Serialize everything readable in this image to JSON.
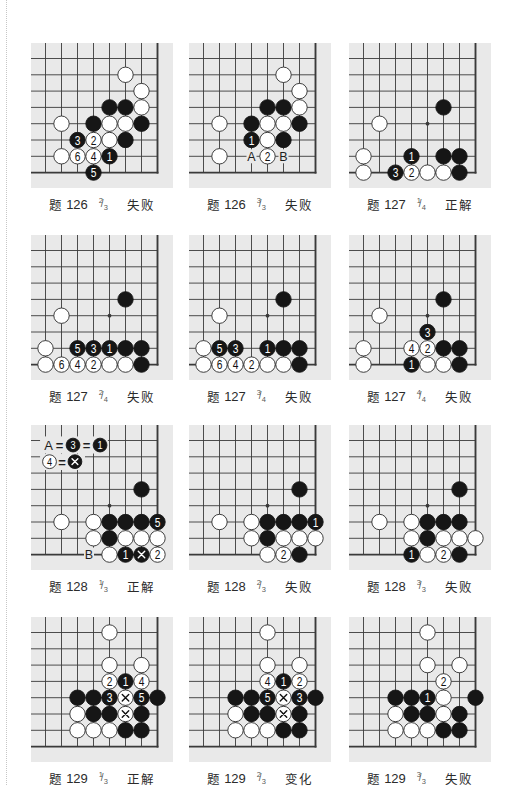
{
  "colors": {
    "board": "#e9e9e9",
    "line": "#3a3a3a",
    "black": "#161616",
    "white": "#ffffff",
    "stone_edge": "#2a2a2a",
    "caption": "#2b2b2b"
  },
  "diagrams": [
    {
      "problem_label": "题",
      "problem_number": "126",
      "step": {
        "num": "2",
        "sep": "/",
        "den": "3"
      },
      "result": "失败",
      "stones": [
        [
          "w",
          5,
          1
        ],
        [
          "w",
          6,
          2
        ],
        [
          "b",
          4,
          3
        ],
        [
          "b",
          5,
          3
        ],
        [
          "w",
          6,
          3
        ],
        [
          "w",
          1,
          4
        ],
        [
          "b",
          3,
          4
        ],
        [
          "w",
          4,
          4
        ],
        [
          "w",
          5,
          4
        ],
        [
          "b",
          6,
          4
        ],
        [
          "b",
          2,
          5,
          "3"
        ],
        [
          "w",
          3,
          5,
          "2"
        ],
        [
          "w",
          4,
          5
        ],
        [
          "b",
          5,
          5
        ],
        [
          "w",
          1,
          6
        ],
        [
          "w",
          2,
          6,
          "6"
        ],
        [
          "w",
          3,
          6,
          "4"
        ],
        [
          "b",
          4,
          6,
          "1"
        ],
        [
          "b",
          3,
          7,
          "5"
        ]
      ]
    },
    {
      "problem_label": "题",
      "problem_number": "126",
      "step": {
        "num": "3",
        "sep": "/",
        "den": "3"
      },
      "result": "失败",
      "stones": [
        [
          "w",
          5,
          1
        ],
        [
          "w",
          6,
          2
        ],
        [
          "b",
          4,
          3
        ],
        [
          "b",
          5,
          3
        ],
        [
          "w",
          6,
          3
        ],
        [
          "w",
          1,
          4
        ],
        [
          "b",
          3,
          4
        ],
        [
          "w",
          4,
          4
        ],
        [
          "w",
          5,
          4
        ],
        [
          "b",
          6,
          4
        ],
        [
          "b",
          3,
          5,
          "1"
        ],
        [
          "w",
          4,
          5
        ],
        [
          "b",
          5,
          5
        ],
        [
          "w",
          1,
          6
        ],
        [
          "w",
          4,
          6,
          "2"
        ]
      ],
      "labels": [
        {
          "col": 3,
          "row": 6,
          "text": "A"
        },
        {
          "col": 5,
          "row": 6,
          "text": "B"
        }
      ]
    },
    {
      "problem_label": "题",
      "problem_number": "127",
      "step": {
        "num": "1",
        "sep": "/",
        "den": "4"
      },
      "result": "正解",
      "stones": [
        [
          "b",
          5,
          3
        ],
        [
          "w",
          1,
          4
        ],
        [
          "w",
          0,
          6
        ],
        [
          "b",
          3,
          6,
          "1"
        ],
        [
          "b",
          5,
          6
        ],
        [
          "b",
          6,
          6
        ],
        [
          "w",
          0,
          7
        ],
        [
          "b",
          2,
          7,
          "3"
        ],
        [
          "w",
          3,
          7,
          "2"
        ],
        [
          "w",
          4,
          7
        ],
        [
          "w",
          5,
          7
        ],
        [
          "b",
          6,
          7
        ]
      ]
    },
    {
      "problem_label": "题",
      "problem_number": "127",
      "step": {
        "num": "2",
        "sep": "/",
        "den": "4"
      },
      "result": "失败",
      "stones": [
        [
          "b",
          5,
          3
        ],
        [
          "w",
          1,
          4
        ],
        [
          "w",
          0,
          6
        ],
        [
          "b",
          2,
          6,
          "5"
        ],
        [
          "b",
          3,
          6,
          "3"
        ],
        [
          "b",
          4,
          6,
          "1"
        ],
        [
          "b",
          5,
          6
        ],
        [
          "b",
          6,
          6
        ],
        [
          "w",
          0,
          7
        ],
        [
          "w",
          1,
          7,
          "6"
        ],
        [
          "w",
          2,
          7,
          "4"
        ],
        [
          "w",
          3,
          7,
          "2"
        ],
        [
          "w",
          4,
          7
        ],
        [
          "w",
          5,
          7
        ],
        [
          "b",
          6,
          7
        ]
      ]
    },
    {
      "problem_label": "题",
      "problem_number": "127",
      "step": {
        "num": "3",
        "sep": "/",
        "den": "4"
      },
      "result": "失败",
      "stones": [
        [
          "b",
          5,
          3
        ],
        [
          "w",
          1,
          4
        ],
        [
          "w",
          0,
          6
        ],
        [
          "b",
          1,
          6,
          "5"
        ],
        [
          "b",
          2,
          6,
          "3"
        ],
        [
          "b",
          4,
          6,
          "1"
        ],
        [
          "b",
          5,
          6
        ],
        [
          "b",
          6,
          6
        ],
        [
          "w",
          0,
          7
        ],
        [
          "w",
          1,
          7,
          "6"
        ],
        [
          "w",
          2,
          7,
          "4"
        ],
        [
          "w",
          3,
          7,
          "2"
        ],
        [
          "w",
          4,
          7
        ],
        [
          "w",
          5,
          7
        ],
        [
          "b",
          6,
          7
        ]
      ]
    },
    {
      "problem_label": "题",
      "problem_number": "127",
      "step": {
        "num": "4",
        "sep": "/",
        "den": "4"
      },
      "result": "失败",
      "stones": [
        [
          "b",
          5,
          3
        ],
        [
          "w",
          1,
          4
        ],
        [
          "b",
          4,
          5,
          "3"
        ],
        [
          "w",
          0,
          6
        ],
        [
          "w",
          3,
          6,
          "4"
        ],
        [
          "w",
          4,
          6,
          "2"
        ],
        [
          "b",
          5,
          6
        ],
        [
          "b",
          6,
          6
        ],
        [
          "w",
          0,
          7
        ],
        [
          "b",
          3,
          7,
          "1"
        ],
        [
          "w",
          4,
          7
        ],
        [
          "w",
          5,
          7
        ],
        [
          "b",
          6,
          7
        ]
      ]
    },
    {
      "problem_label": "题",
      "problem_number": "128",
      "step": {
        "num": "1",
        "sep": "/",
        "den": "3"
      },
      "result": "正解",
      "stones": [
        [
          "b",
          6,
          3
        ],
        [
          "w",
          1,
          5
        ],
        [
          "w",
          3,
          5
        ],
        [
          "b",
          4,
          5
        ],
        [
          "b",
          5,
          5
        ],
        [
          "b",
          6,
          5
        ],
        [
          "b",
          7,
          5,
          "5"
        ],
        [
          "w",
          3,
          6
        ],
        [
          "b",
          4,
          6
        ],
        [
          "w",
          5,
          6
        ],
        [
          "w",
          6,
          6
        ],
        [
          "w",
          7,
          6
        ],
        [
          "w",
          4,
          7
        ],
        [
          "b",
          5,
          7,
          "1"
        ],
        [
          "b",
          6,
          7,
          "×"
        ],
        [
          "w",
          7,
          7,
          "2"
        ]
      ],
      "labels": [
        {
          "col": 2.72,
          "row": 7,
          "text": "B"
        }
      ],
      "annotations": [
        {
          "row": 0.28,
          "box": {
            "c1": -0.34,
            "r1": -0.25,
            "c2": 3.9,
            "r2": 0.8
          },
          "items": [
            {
              "col": 0.19,
              "text": "A"
            },
            {
              "col": 0.875,
              "text": "="
            },
            {
              "col": 1.72,
              "stone": "b",
              "text": "3"
            },
            {
              "col": 2.56,
              "text": "="
            },
            {
              "col": 3.41,
              "stone": "b",
              "text": "1"
            }
          ]
        },
        {
          "row": 1.3,
          "box": {
            "c1": -0.34,
            "r1": 0.83,
            "c2": 2.47,
            "r2": 1.81
          },
          "items": [
            {
              "col": 0.25,
              "stone": "w",
              "text": "4"
            },
            {
              "col": 1.03,
              "text": "="
            },
            {
              "col": 1.84,
              "stone": "b",
              "text": "×"
            }
          ]
        }
      ]
    },
    {
      "problem_label": "题",
      "problem_number": "128",
      "step": {
        "num": "2",
        "sep": "/",
        "den": "3"
      },
      "result": "失败",
      "stones": [
        [
          "b",
          6,
          3
        ],
        [
          "w",
          1,
          5
        ],
        [
          "w",
          3,
          5
        ],
        [
          "b",
          4,
          5
        ],
        [
          "b",
          5,
          5
        ],
        [
          "b",
          6,
          5
        ],
        [
          "b",
          7,
          5,
          "1"
        ],
        [
          "w",
          3,
          6
        ],
        [
          "b",
          4,
          6
        ],
        [
          "w",
          5,
          6
        ],
        [
          "w",
          6,
          6
        ],
        [
          "w",
          7,
          6
        ],
        [
          "w",
          4,
          7
        ],
        [
          "w",
          5,
          7,
          "2"
        ],
        [
          "b",
          6,
          7
        ]
      ]
    },
    {
      "problem_label": "题",
      "problem_number": "128",
      "step": {
        "num": "3",
        "sep": "/",
        "den": "3"
      },
      "result": "失败",
      "stones": [
        [
          "b",
          6,
          3
        ],
        [
          "w",
          1,
          5
        ],
        [
          "w",
          3,
          5
        ],
        [
          "b",
          4,
          5
        ],
        [
          "b",
          5,
          5
        ],
        [
          "b",
          6,
          5
        ],
        [
          "w",
          3,
          6
        ],
        [
          "b",
          4,
          6
        ],
        [
          "w",
          5,
          6
        ],
        [
          "w",
          6,
          6
        ],
        [
          "w",
          7,
          6
        ],
        [
          "b",
          3,
          7,
          "1"
        ],
        [
          "w",
          4,
          7
        ],
        [
          "w",
          5,
          7,
          "2"
        ],
        [
          "b",
          6,
          7
        ]
      ]
    },
    {
      "problem_label": "题",
      "problem_number": "129",
      "step": {
        "num": "1",
        "sep": "/",
        "den": "3"
      },
      "result": "正解",
      "stones": [
        [
          "w",
          4,
          0
        ],
        [
          "w",
          4,
          2
        ],
        [
          "w",
          6,
          2
        ],
        [
          "w",
          4,
          3,
          "2"
        ],
        [
          "b",
          5,
          3,
          "1"
        ],
        [
          "w",
          6,
          3,
          "4"
        ],
        [
          "b",
          2,
          4
        ],
        [
          "b",
          3,
          4
        ],
        [
          "b",
          4,
          4,
          "3"
        ],
        [
          "w",
          5,
          4,
          "×"
        ],
        [
          "b",
          6,
          4,
          "5"
        ],
        [
          "b",
          7,
          4
        ],
        [
          "w",
          2,
          5
        ],
        [
          "b",
          3,
          5
        ],
        [
          "b",
          4,
          5
        ],
        [
          "w",
          5,
          5,
          "×"
        ],
        [
          "b",
          6,
          5
        ],
        [
          "w",
          2,
          6
        ],
        [
          "w",
          3,
          6
        ],
        [
          "w",
          4,
          6
        ],
        [
          "b",
          5,
          6
        ],
        [
          "b",
          6,
          6
        ]
      ]
    },
    {
      "problem_label": "题",
      "problem_number": "129",
      "step": {
        "num": "2",
        "sep": "/",
        "den": "3"
      },
      "result": "变化",
      "stones": [
        [
          "w",
          4,
          0
        ],
        [
          "w",
          4,
          2
        ],
        [
          "w",
          6,
          2
        ],
        [
          "w",
          4,
          3,
          "4"
        ],
        [
          "b",
          5,
          3,
          "1"
        ],
        [
          "w",
          6,
          3,
          "2"
        ],
        [
          "b",
          2,
          4
        ],
        [
          "b",
          3,
          4
        ],
        [
          "b",
          4,
          4,
          "5"
        ],
        [
          "w",
          5,
          4,
          "×"
        ],
        [
          "b",
          6,
          4,
          "3"
        ],
        [
          "b",
          7,
          4
        ],
        [
          "w",
          2,
          5
        ],
        [
          "b",
          3,
          5
        ],
        [
          "b",
          4,
          5
        ],
        [
          "w",
          5,
          5,
          "×"
        ],
        [
          "b",
          6,
          5
        ],
        [
          "w",
          2,
          6
        ],
        [
          "w",
          3,
          6
        ],
        [
          "w",
          4,
          6
        ],
        [
          "b",
          5,
          6
        ],
        [
          "b",
          6,
          6
        ]
      ]
    },
    {
      "problem_label": "题",
      "problem_number": "129",
      "step": {
        "num": "3",
        "sep": "/",
        "den": "3"
      },
      "result": "失败",
      "stones": [
        [
          "w",
          4,
          0
        ],
        [
          "w",
          4,
          2
        ],
        [
          "w",
          6,
          2
        ],
        [
          "w",
          5,
          3,
          "2"
        ],
        [
          "b",
          2,
          4
        ],
        [
          "b",
          3,
          4
        ],
        [
          "b",
          4,
          4,
          "1"
        ],
        [
          "w",
          5,
          4
        ],
        [
          "b",
          7,
          4
        ],
        [
          "w",
          2,
          5
        ],
        [
          "b",
          3,
          5
        ],
        [
          "b",
          4,
          5
        ],
        [
          "w",
          5,
          5
        ],
        [
          "b",
          6,
          5
        ],
        [
          "w",
          2,
          6
        ],
        [
          "w",
          3,
          6
        ],
        [
          "w",
          4,
          6
        ],
        [
          "b",
          5,
          6
        ],
        [
          "b",
          6,
          6
        ]
      ]
    }
  ]
}
